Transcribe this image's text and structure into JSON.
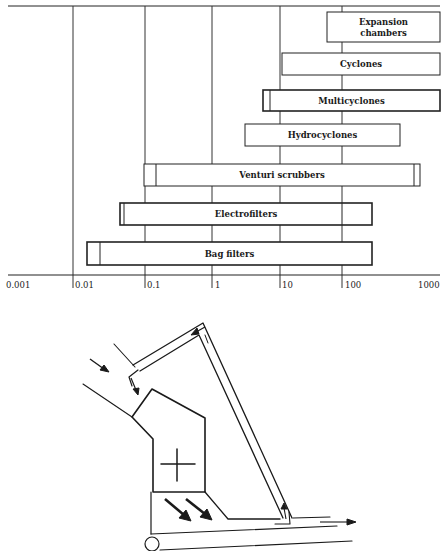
{
  "chart_data": {
    "type": "bar",
    "orientation": "horizontal-range",
    "title": "",
    "xlabel": "",
    "ylabel": "",
    "xscale": "log",
    "xlim": [
      0.001,
      1000
    ],
    "x_ticks": [
      "0.001",
      "0.01",
      "0.1",
      "1",
      "10",
      "100",
      "1000"
    ],
    "grid": true,
    "series": [
      {
        "name": "Expansion chambers",
        "label_lines": [
          "Expansion",
          "chambers"
        ],
        "range": [
          50,
          1000
        ],
        "main_range": [
          50,
          1000
        ]
      },
      {
        "name": "Cyclones",
        "label_lines": [
          "Cyclones"
        ],
        "range": [
          10,
          1000
        ],
        "main_range": [
          10,
          1000
        ]
      },
      {
        "name": "Multicyclones",
        "label_lines": [
          "Multicyclones"
        ],
        "range": [
          5,
          1000
        ],
        "main_range": [
          6,
          1000
        ]
      },
      {
        "name": "Hydrocyclones",
        "label_lines": [
          "Hydrocyclones"
        ],
        "range": [
          2.5,
          400
        ],
        "main_range": [
          2.5,
          400
        ]
      },
      {
        "name": "Venturi scrubbers",
        "label_lines": [
          "Venturi scrubbers"
        ],
        "range": [
          0.1,
          900
        ],
        "main_range": [
          0.13,
          700
        ]
      },
      {
        "name": "Electrofilters",
        "label_lines": [
          "Electrofilters"
        ],
        "range": [
          0.04,
          200
        ],
        "main_range": [
          0.045,
          90
        ]
      },
      {
        "name": "Bag filters",
        "label_lines": [
          "Bag filters"
        ],
        "range": [
          0.012,
          200
        ],
        "main_range": [
          0.018,
          200
        ]
      }
    ]
  },
  "axis": {
    "ticks": [
      {
        "label": "0.001",
        "x": 6
      },
      {
        "label": "0.01",
        "x": 75
      },
      {
        "label": "0.1",
        "x": 147
      },
      {
        "label": "1",
        "x": 215
      },
      {
        "label": "10",
        "x": 282
      },
      {
        "label": "100",
        "x": 345
      },
      {
        "label": "1000",
        "x": 418
      }
    ]
  },
  "bars": [
    {
      "label_lines": [
        "Expansion",
        "chambers"
      ],
      "x1": 327,
      "x2": 440,
      "inner_x": null,
      "inner_x2": null,
      "y": 12,
      "h": 30,
      "bold": false
    },
    {
      "label_lines": [
        "Cyclones"
      ],
      "x1": 282,
      "x2": 440,
      "inner_x": null,
      "inner_x2": null,
      "y": 53,
      "h": 22,
      "bold": false
    },
    {
      "label_lines": [
        "Multicyclones"
      ],
      "x1": 263,
      "x2": 440,
      "inner_x": 270,
      "inner_x2": null,
      "y": 90,
      "h": 21,
      "bold": true
    },
    {
      "label_lines": [
        "Hydrocyclones"
      ],
      "x1": 245,
      "x2": 400,
      "inner_x": null,
      "inner_x2": null,
      "y": 124,
      "h": 22,
      "bold": false
    },
    {
      "label_lines": [
        "Venturi scrubbers"
      ],
      "x1": 144,
      "x2": 420,
      "inner_x": 156,
      "inner_x2": 414,
      "y": 164,
      "h": 22,
      "bold": false
    },
    {
      "label_lines": [
        "Electrofilters"
      ],
      "x1": 120,
      "x2": 372,
      "inner_x": 124,
      "inner_x2": 342,
      "y": 203,
      "h": 22,
      "bold": true
    },
    {
      "label_lines": [
        "Bag filters"
      ],
      "x1": 87,
      "x2": 372,
      "inner_x": 100,
      "inner_x2": null,
      "y": 242,
      "h": 23,
      "bold": true
    }
  ],
  "gridlines_x": [
    73,
    145,
    212,
    280,
    342
  ],
  "diagram": {
    "labels": {
      "crosshair": "center-mark",
      "inlet": "inlet-arrow",
      "outlet": "outlet-arrow"
    }
  }
}
